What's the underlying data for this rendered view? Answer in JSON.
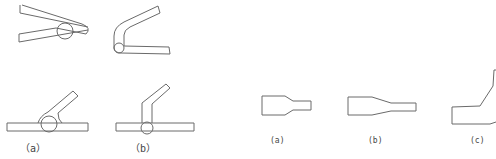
{
  "figure_left": {
    "labels": {
      "a": "（a）",
      "b": "（b）"
    }
  },
  "figure_right": {
    "labels": {
      "a": "(a)",
      "b": "(b)",
      "c": "(c)"
    }
  }
}
